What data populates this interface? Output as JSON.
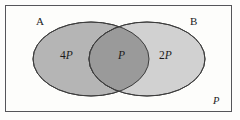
{
  "diagram": {
    "type": "venn-two-set",
    "title": "",
    "universe_label": "P",
    "sets": [
      {
        "id": "A",
        "label": "A",
        "region_value": "4P",
        "region_coefficient": "4",
        "region_symbol": "P",
        "fill_color": "#b5b5b5",
        "stroke_color": "#3d3d3d"
      },
      {
        "id": "B",
        "label": "B",
        "region_value": "2P",
        "region_coefficient": "2",
        "region_symbol": "P",
        "fill_color": "#cfcfcf",
        "stroke_color": "#3d3d3d"
      }
    ],
    "intersection": {
      "label": "P",
      "coefficient": "",
      "symbol": "P",
      "fill_color": "#9a9a9a"
    },
    "frame": {
      "border_color": "#55555a",
      "background_color": "#fdfdfb"
    },
    "page_background": "#ffffff"
  }
}
